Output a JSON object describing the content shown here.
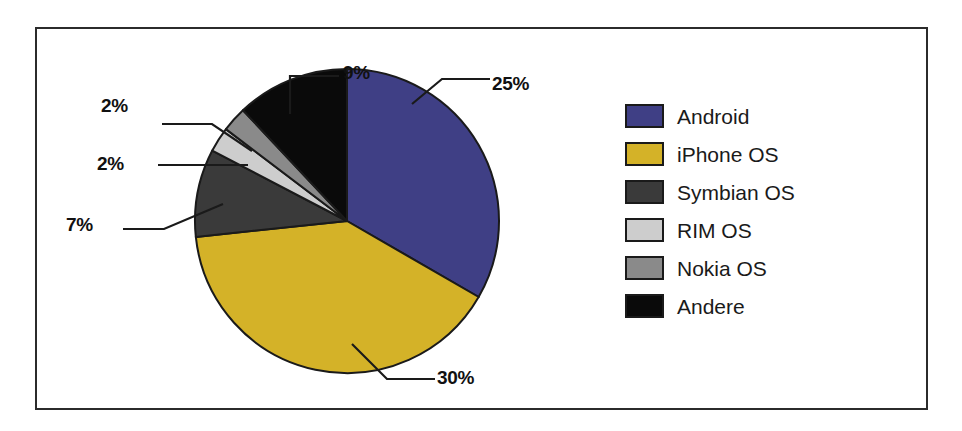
{
  "chart_data": {
    "type": "pie",
    "title": "",
    "subtitle": "",
    "xlabel": "",
    "ylabel": "",
    "grid": false,
    "legend_position": "right",
    "start_angle_deg": 0,
    "direction": "clockwise",
    "categories": [
      "Android",
      "iPhone OS",
      "Symbian OS",
      "RIM OS",
      "Nokia OS",
      "Andere"
    ],
    "values": [
      25,
      30,
      7,
      2,
      2,
      9
    ],
    "data_labels": [
      "25%",
      "30%",
      "7%",
      "2%",
      "2%",
      "9%"
    ],
    "colors": [
      "#3f3f85",
      "#d4b228",
      "#3a3a3a",
      "#cdcdcd",
      "#8a8a8a",
      "#0a0a0a"
    ],
    "slices": [
      {
        "label": "Android",
        "value": 25,
        "data_label": "25%",
        "color": "#3f3f85"
      },
      {
        "label": "iPhone OS",
        "value": 30,
        "data_label": "30%",
        "color": "#d4b228"
      },
      {
        "label": "Symbian OS",
        "value": 7,
        "data_label": "7%",
        "color": "#3a3a3a"
      },
      {
        "label": "RIM OS",
        "value": 2,
        "data_label": "2%",
        "color": "#cdcdcd"
      },
      {
        "label": "Nokia OS",
        "value": 2,
        "data_label": "2%",
        "color": "#8a8a8a"
      },
      {
        "label": "Andere",
        "value": 9,
        "data_label": "9%",
        "color": "#0a0a0a"
      }
    ]
  },
  "labels": {
    "android": "25%",
    "iphone": "30%",
    "symbian": "7%",
    "rim": "2%",
    "nokia": "2%",
    "andere": "9%"
  },
  "legend": {
    "items": [
      {
        "label": "Android",
        "color": "#3f3f85"
      },
      {
        "label": "iPhone OS",
        "color": "#d4b228"
      },
      {
        "label": "Symbian OS",
        "color": "#3a3a3a"
      },
      {
        "label": "RIM OS",
        "color": "#cdcdcd"
      },
      {
        "label": "Nokia OS",
        "color": "#8a8a8a"
      },
      {
        "label": "Andere",
        "color": "#0a0a0a"
      }
    ]
  },
  "style": {
    "frame_border": "#2b2b2b",
    "background": "#ffffff",
    "slice_outline": "#1a1a1a",
    "leader_line": "#1a1a1a",
    "label_text": "#111111"
  }
}
